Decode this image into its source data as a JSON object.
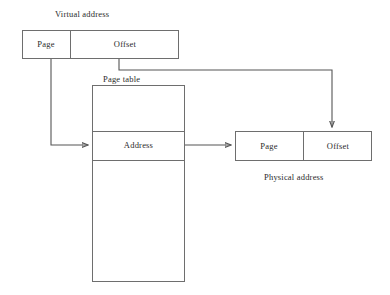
{
  "diagram": {
    "type": "block-diagram",
    "background_color": "#ffffff",
    "stroke_color": "#6e6e6e",
    "text_color": "#2b2b2b"
  },
  "captions": {
    "virtual_address": "Virtual address",
    "page_table": "Page table",
    "physical_address": "Physical address"
  },
  "virtual_address_box": {
    "fields": [
      {
        "label": "Page"
      },
      {
        "label": "Offset"
      }
    ]
  },
  "page_table_box": {
    "rows": [
      {
        "label": ""
      },
      {
        "label": "Address"
      },
      {
        "label": ""
      }
    ]
  },
  "physical_address_box": {
    "fields": [
      {
        "label": "Page"
      },
      {
        "label": "Offset"
      }
    ]
  },
  "connectors": [
    {
      "name": "page-to-page-table",
      "from": "virtual-page-field",
      "to": "page-table-address-row"
    },
    {
      "name": "offset-to-physical-offset",
      "from": "virtual-offset-field",
      "to": "physical-offset-field"
    },
    {
      "name": "address-to-physical-page",
      "from": "page-table-address-row",
      "to": "physical-page-field"
    }
  ]
}
